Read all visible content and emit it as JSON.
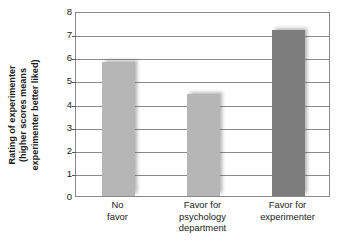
{
  "chart_data": {
    "type": "bar",
    "title": "",
    "xlabel": "",
    "ylabel": "Rating of experimenter (higher scores means experimenter better liked)",
    "ylabel_lines": [
      "Rating of experimenter",
      "(higher scores means",
      "experimenter better liked)"
    ],
    "categories": [
      "No favor",
      "Favor for psychology department",
      "Favor for experimenter"
    ],
    "category_lines": [
      [
        "No",
        "favor"
      ],
      [
        "Favor for",
        "psychology",
        "department"
      ],
      [
        "Favor for",
        "experimenter"
      ]
    ],
    "values": [
      5.8,
      4.4,
      7.2
    ],
    "ylim": [
      0,
      8
    ],
    "ytick_step": 1,
    "ytick_labels": [
      "8",
      "7",
      "6",
      "5",
      "4",
      "3",
      "2",
      "1",
      "0"
    ],
    "ytick_values": [
      8,
      7,
      6,
      5,
      4,
      3,
      2,
      1,
      0
    ],
    "grid": true,
    "legend": "none",
    "bar_colors": [
      "#b6b6b6",
      "#b6b6b6",
      "#7d7d7d"
    ],
    "axis_color": "#8a8a8a",
    "text_color": "#1a1a1a"
  }
}
